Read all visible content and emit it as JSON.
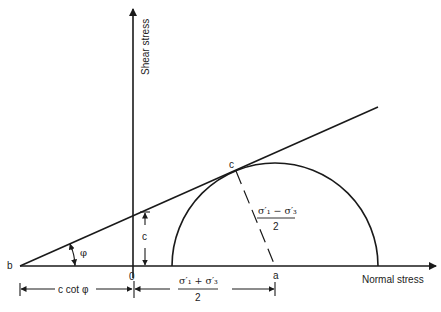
{
  "diagram": {
    "axes": {
      "vertical_label": "Shear stress",
      "horizontal_label": "Normal stress",
      "origin_label": "0"
    },
    "points": {
      "b": "b",
      "c": "c",
      "a": "a"
    },
    "labels": {
      "phi": "φ",
      "cohesion": "c",
      "c_cot_phi": "c cot φ",
      "radius_numerator": "σ′₁ − σ′₃",
      "radius_denominator": "2",
      "center_numerator": "σ′₁ + σ′₃",
      "center_denominator": "2"
    },
    "colors": {
      "line": "#1a1a1a",
      "background": "#ffffff"
    }
  }
}
